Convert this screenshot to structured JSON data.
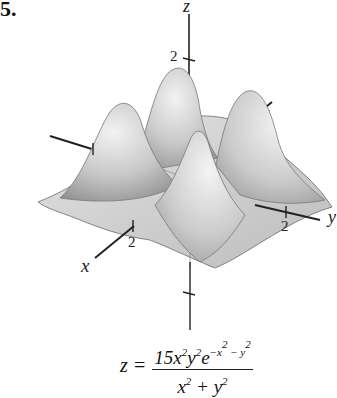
{
  "problem": {
    "number": "5."
  },
  "figure": {
    "type": "3d-surface-plot",
    "axes": {
      "x": {
        "label": "x",
        "tick_label": "2"
      },
      "y": {
        "label": "y",
        "tick_label": "2"
      },
      "z": {
        "label": "z",
        "tick_label": "2"
      }
    },
    "surface_description": "Four Gaussian-like peaks arranged symmetrically around origin, surface shaded gray"
  },
  "formula": {
    "lhs": "z =",
    "numerator_html": "15x<sup>2</sup>y<sup>2</sup>e<sup>−x<sup>2</sup> − y<sup>2</sup></sup>",
    "denominator_html": "x<sup>2</sup> + y<sup>2</sup>",
    "text": "z = 15x^2 y^2 e^(-x^2 - y^2) / (x^2 + y^2)"
  }
}
